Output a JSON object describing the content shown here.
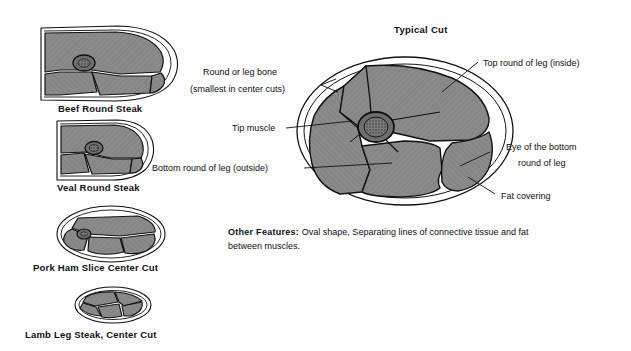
{
  "figure": {
    "title": "Typical Cut",
    "background_color": "#fdfdfd",
    "muscle_fill_color": "#8a8a8a",
    "fat_fill_color": "#ffffff",
    "bone_fill_color": "#6e6e6e",
    "outline_color": "#111111"
  },
  "specimens": [
    {
      "id": "beef-round-steak",
      "caption": "Beef Round Steak"
    },
    {
      "id": "veal-round-steak",
      "caption": "Veal Round Steak"
    },
    {
      "id": "pork-ham-slice-center-cut",
      "caption": "Pork Ham Slice Center Cut"
    },
    {
      "id": "lamb-leg-steak-center-cut",
      "caption": "Lamb Leg Steak, Center Cut"
    }
  ],
  "callouts": {
    "round_or_leg_bone_line1": "Round or leg bone",
    "round_or_leg_bone_line2": "(smallest in center cuts)",
    "tip_muscle": "Tip muscle",
    "bottom_round_outside": "Bottom round of leg (outside)",
    "top_round_inside": "Top round of leg (inside)",
    "eye_bottom_round_line1": "Eye of the bottom",
    "eye_bottom_round_line2": "round of leg",
    "fat_covering": "Fat covering"
  },
  "other_features": {
    "heading": "Other Features:",
    "text": "Oval shape, Separating lines of connective tissue and fat between muscles."
  }
}
